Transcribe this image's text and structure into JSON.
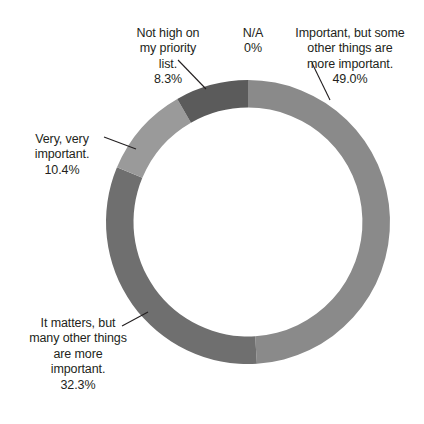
{
  "chart_data": {
    "type": "pie",
    "variant": "donut",
    "title": "",
    "subtitle": "",
    "xlabel": "",
    "ylabel": "",
    "legend": "none",
    "grid": false,
    "label_format": "percent-one-decimal",
    "categories": [
      "Important, but some other things are more important.",
      "It matters, but many other things are more important.",
      "Very, very important.",
      "Not high on my priority list.",
      "N/A"
    ],
    "values": [
      49.0,
      32.3,
      10.4,
      8.3,
      0
    ],
    "value_labels": [
      "49.0%",
      "32.3%",
      "10.4%",
      "8.3%",
      "0%"
    ],
    "colors": [
      "#8a8a8a",
      "#6f6f6f",
      "#9a9a9a",
      "#5b5b5b",
      "#bfbfbf"
    ],
    "slices": [
      {
        "label": "Important, but some other things are more important.",
        "value": 49.0,
        "value_label": "49.0%",
        "color": "#8a8a8a",
        "start_deg": 0,
        "end_deg": 176.4
      },
      {
        "label": "It matters, but many other things are more important.",
        "value": 32.3,
        "value_label": "32.3%",
        "color": "#6f6f6f",
        "start_deg": 176.4,
        "end_deg": 292.68
      },
      {
        "label": "Very, very important.",
        "value": 10.4,
        "value_label": "10.4%",
        "color": "#9a9a9a",
        "start_deg": 292.68,
        "end_deg": 330.12
      },
      {
        "label": "Not high on my priority list.",
        "value": 8.3,
        "value_label": "8.3%",
        "color": "#5b5b5b",
        "start_deg": 330.12,
        "end_deg": 360.0
      },
      {
        "label": "N/A",
        "value": 0,
        "value_label": "0%",
        "color": "#bfbfbf",
        "start_deg": 360.0,
        "end_deg": 360.0
      }
    ]
  },
  "labels": {
    "not_high": {
      "text": "Not high on\nmy priority\nlist.",
      "pct": "8.3%"
    },
    "na": {
      "text": "N/A",
      "pct": "0%"
    },
    "important_but": {
      "text": "Important, but some\nother things are\nmore important.",
      "pct": "49.0%"
    },
    "very_very": {
      "text": "Very, very\nimportant.",
      "pct": "10.4%"
    },
    "it_matters": {
      "text": "It matters, but\nmany other things\nare more\nimportant.",
      "pct": "32.3%"
    }
  }
}
